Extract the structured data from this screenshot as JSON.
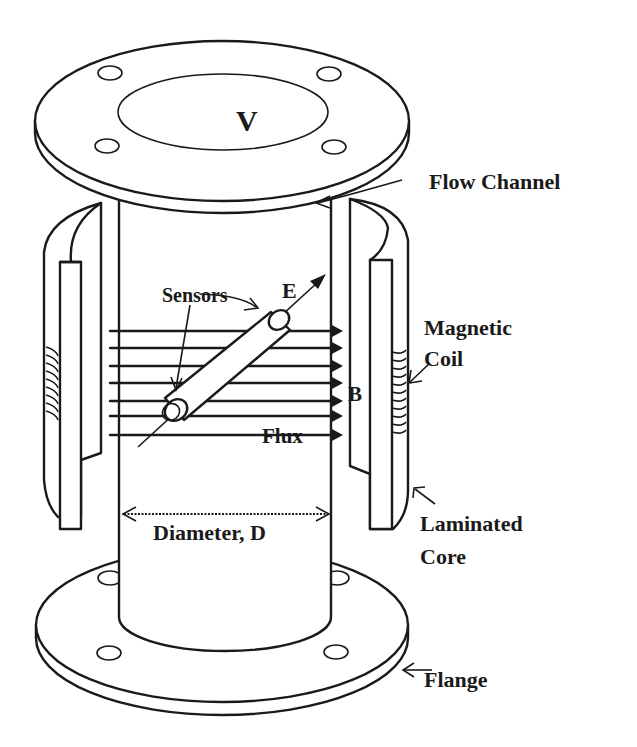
{
  "diagram": {
    "colors": {
      "ink": "#1a1a1a",
      "background": "#ffffff"
    },
    "labels": {
      "velocity": "V",
      "flow_channel": "Flow Channel",
      "sensors": "Sensors",
      "electric_field": "E",
      "magnetic_field": "B",
      "flux": "Flux",
      "magnetic_coil_line1": "Magnetic",
      "magnetic_coil_line2": "Coil",
      "diameter": "Diameter, D",
      "laminated_core_line1": "Laminated",
      "laminated_core_line2": "Core",
      "flange": "Flange"
    },
    "components": [
      "top-flange",
      "flow-channel",
      "left-laminated-core",
      "right-laminated-core",
      "left-magnetic-coil",
      "right-magnetic-coil",
      "sensor-electrode-rod",
      "magnetic-flux-lines",
      "bottom-flange"
    ],
    "flux_line_count": 7,
    "bolt_holes_per_flange": 4
  }
}
